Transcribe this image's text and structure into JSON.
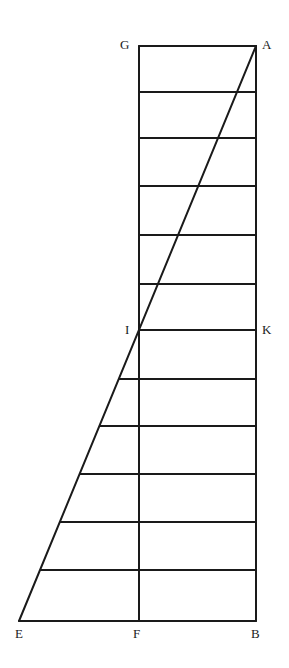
{
  "diagram": {
    "type": "geometric-construction",
    "stroke_color": "#1a1a1a",
    "background": "#ffffff",
    "points": {
      "G": {
        "label": "G",
        "x": 139,
        "y": 46
      },
      "A": {
        "label": "A",
        "x": 256,
        "y": 46
      },
      "I": {
        "label": "I",
        "x": 139,
        "y": 330
      },
      "K": {
        "label": "K",
        "x": 256,
        "y": 330
      },
      "E": {
        "label": "E",
        "x": 19,
        "y": 621
      },
      "F": {
        "label": "F",
        "x": 139,
        "y": 621
      },
      "B": {
        "label": "B",
        "x": 256,
        "y": 621
      }
    },
    "labels": {
      "G": "G",
      "A": "A",
      "I": "I",
      "K": "K",
      "E": "E",
      "F": "F",
      "B": "B"
    },
    "upper_rungs_y": [
      92,
      138,
      186,
      235,
      284
    ],
    "lower_rungs_y": [
      379,
      426,
      474,
      522,
      570
    ]
  }
}
